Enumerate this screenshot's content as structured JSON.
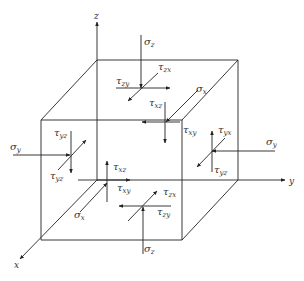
{
  "axes": {
    "x": "x",
    "y": "y",
    "z": "z"
  },
  "labels": {
    "sigma_z_top": {
      "sym": "σ",
      "sub": "z"
    },
    "tau_zx_top": {
      "sym": "τ",
      "sub": "zx"
    },
    "tau_zy_top": {
      "sym": "τ",
      "sub": "zy"
    },
    "sigma_x_back": {
      "sym": "σ",
      "sub": "x"
    },
    "tau_xz_back": {
      "sym": "τ",
      "sub": "xz"
    },
    "tau_xy_back": {
      "sym": "τ",
      "sub": "xy"
    },
    "sigma_y_left": {
      "sym": "σ",
      "sub": "y"
    },
    "tau_yz_left_top": {
      "sym": "τ",
      "sub": "yz"
    },
    "tau_yz_left_bot": {
      "sym": "τ",
      "sub": "yz"
    },
    "sigma_y_right": {
      "sym": "σ",
      "sub": "y"
    },
    "tau_yx_right": {
      "sym": "τ",
      "sub": "yx"
    },
    "tau_yz_right": {
      "sym": "τ",
      "sub": "yz"
    },
    "tau_xz_front": {
      "sym": "τ",
      "sub": "xz"
    },
    "tau_xy_front": {
      "sym": "τ",
      "sub": "xy"
    },
    "sigma_x_front": {
      "sym": "σ",
      "sub": "x"
    },
    "tau_zx_bottom": {
      "sym": "τ",
      "sub": "zx"
    },
    "tau_zy_bottom": {
      "sym": "τ",
      "sub": "zy"
    },
    "sigma_z_bottom": {
      "sym": "σ",
      "sub": "z"
    }
  }
}
